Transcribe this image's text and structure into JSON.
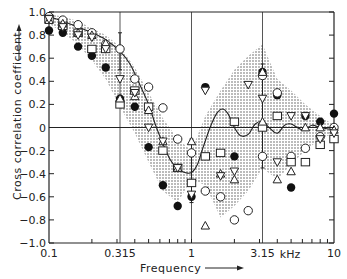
{
  "chart_data": {
    "type": "scatter",
    "title": "",
    "xlabel": "Frequency",
    "xlabel_unit": "kHz",
    "ylabel": "Cross correlation coefficient",
    "xscale": "log",
    "xlim": [
      0.1,
      10
    ],
    "ylim": [
      -1.0,
      1.0
    ],
    "x_ticks": [
      {
        "value": 0.1,
        "label": "0.1"
      },
      {
        "value": 0.315,
        "label": "0.315"
      },
      {
        "value": 1,
        "label": "1"
      },
      {
        "value": 3.15,
        "label": "3.15"
      },
      {
        "value": 10,
        "label": "10"
      }
    ],
    "y_ticks": [
      {
        "value": 1.0,
        "label": "1.0"
      },
      {
        "value": 0.8,
        "label": "0.8"
      },
      {
        "value": 0.6,
        "label": "0.6"
      },
      {
        "value": 0.4,
        "label": "0.4"
      },
      {
        "value": 0.2,
        "label": "0.2"
      },
      {
        "value": 0,
        "label": "0"
      },
      {
        "value": -0.2,
        "label": "-0.2"
      },
      {
        "value": -0.4,
        "label": "-0.4"
      },
      {
        "value": -0.6,
        "label": "-0.6"
      },
      {
        "value": -0.8,
        "label": "-0.8"
      },
      {
        "value": -1.0,
        "label": "-1.0"
      }
    ],
    "grid": {
      "vertical_lines_at": [
        0.315,
        1,
        3.15
      ],
      "horizontal_lines_at": [
        0
      ]
    },
    "shaded_band": {
      "upper": [
        [
          0.1,
          0.98
        ],
        [
          0.125,
          0.96
        ],
        [
          0.16,
          0.92
        ],
        [
          0.2,
          0.86
        ],
        [
          0.25,
          0.8
        ],
        [
          0.315,
          0.7
        ],
        [
          0.4,
          0.52
        ],
        [
          0.5,
          0.3
        ],
        [
          0.63,
          0.08
        ],
        [
          0.8,
          -0.1
        ],
        [
          1.0,
          -0.2
        ],
        [
          1.25,
          0.1
        ],
        [
          1.6,
          0.32
        ],
        [
          2.0,
          0.5
        ],
        [
          2.5,
          0.62
        ],
        [
          3.15,
          0.72
        ],
        [
          3.6,
          0.55
        ],
        [
          4.0,
          0.42
        ],
        [
          5.0,
          0.32
        ],
        [
          6.3,
          0.2
        ],
        [
          8.0,
          0.1
        ],
        [
          10,
          0.02
        ]
      ],
      "lower": [
        [
          10,
          -0.05
        ],
        [
          8.0,
          -0.1
        ],
        [
          6.3,
          -0.2
        ],
        [
          5.0,
          -0.32
        ],
        [
          4.0,
          -0.45
        ],
        [
          3.15,
          -0.35
        ],
        [
          2.5,
          -0.55
        ],
        [
          2.0,
          -0.68
        ],
        [
          1.6,
          -0.78
        ],
        [
          1.25,
          -0.5
        ],
        [
          1.0,
          -0.45
        ],
        [
          0.8,
          -0.65
        ],
        [
          0.63,
          -0.55
        ],
        [
          0.5,
          -0.3
        ],
        [
          0.4,
          -0.05
        ],
        [
          0.315,
          0.18
        ],
        [
          0.25,
          0.42
        ],
        [
          0.2,
          0.58
        ],
        [
          0.16,
          0.72
        ],
        [
          0.125,
          0.82
        ],
        [
          0.1,
          0.9
        ]
      ]
    },
    "fit_curve": [
      [
        0.1,
        0.96
      ],
      [
        0.125,
        0.92
      ],
      [
        0.16,
        0.87
      ],
      [
        0.2,
        0.82
      ],
      [
        0.25,
        0.76
      ],
      [
        0.315,
        0.66
      ],
      [
        0.37,
        0.55
      ],
      [
        0.43,
        0.38
      ],
      [
        0.5,
        0.2
      ],
      [
        0.56,
        0.02
      ],
      [
        0.63,
        -0.14
      ],
      [
        0.71,
        -0.28
      ],
      [
        0.8,
        -0.36
      ],
      [
        0.9,
        -0.39
      ],
      [
        1.0,
        -0.39
      ],
      [
        1.1,
        -0.32
      ],
      [
        1.2,
        -0.18
      ],
      [
        1.35,
        0.0
      ],
      [
        1.5,
        0.12
      ],
      [
        1.65,
        0.16
      ],
      [
        1.8,
        0.12
      ],
      [
        2.0,
        0.0
      ],
      [
        2.2,
        -0.07
      ],
      [
        2.5,
        -0.06
      ],
      [
        2.8,
        0.03
      ],
      [
        3.15,
        0.05
      ],
      [
        3.5,
        0.0
      ],
      [
        4.0,
        -0.05
      ],
      [
        4.5,
        0.02
      ],
      [
        5.0,
        0.03
      ],
      [
        6.0,
        -0.02
      ],
      [
        7.0,
        0.02
      ],
      [
        8.0,
        0.0
      ],
      [
        10,
        -0.02
      ]
    ],
    "error_bars": [
      {
        "x": 0.315,
        "y_low": 0.5,
        "y_high": 0.82
      },
      {
        "x": 1.0,
        "y_low": -0.65,
        "y_high": -0.1
      },
      {
        "x": 3.15,
        "y_low": -0.35,
        "y_high": 0.55
      }
    ],
    "series": [
      {
        "name": "filled-circle",
        "marker": "circle-filled",
        "points": [
          [
            0.1,
            0.84
          ],
          [
            0.125,
            0.82
          ],
          [
            0.16,
            0.7
          ],
          [
            0.2,
            0.62
          ],
          [
            0.25,
            0.52
          ],
          [
            0.315,
            0.25
          ],
          [
            0.4,
            0.18
          ],
          [
            0.5,
            -0.17
          ],
          [
            0.63,
            -0.5
          ],
          [
            0.8,
            -0.68
          ],
          [
            1.0,
            -0.6
          ],
          [
            1.25,
            0.35
          ],
          [
            2.0,
            -0.25
          ],
          [
            3.15,
            0.48
          ],
          [
            4.0,
            0.28
          ],
          [
            5.0,
            -0.52
          ],
          [
            6.3,
            0.1
          ],
          [
            8.0,
            0.05
          ],
          [
            10,
            0.12
          ]
        ]
      },
      {
        "name": "open-circle",
        "marker": "circle-open",
        "points": [
          [
            0.1,
            0.96
          ],
          [
            0.125,
            0.93
          ],
          [
            0.16,
            0.89
          ],
          [
            0.2,
            0.82
          ],
          [
            0.25,
            0.72
          ],
          [
            0.315,
            0.68
          ],
          [
            0.4,
            0.42
          ],
          [
            0.5,
            0.35
          ],
          [
            0.63,
            0.17
          ],
          [
            0.8,
            -0.1
          ],
          [
            1.0,
            -0.22
          ],
          [
            1.25,
            -0.55
          ],
          [
            1.6,
            -0.6
          ],
          [
            2.0,
            -0.8
          ],
          [
            2.5,
            -0.72
          ],
          [
            3.15,
            0.45
          ],
          [
            3.15,
            -0.25
          ],
          [
            4.0,
            0.3
          ],
          [
            5.0,
            -0.25
          ],
          [
            6.3,
            -0.18
          ],
          [
            8.0,
            -0.08
          ],
          [
            10,
            0.0
          ]
        ]
      },
      {
        "name": "open-square",
        "marker": "square-open",
        "points": [
          [
            0.1,
            0.94
          ],
          [
            0.125,
            0.88
          ],
          [
            0.16,
            0.82
          ],
          [
            0.2,
            0.68
          ],
          [
            0.25,
            0.68
          ],
          [
            0.315,
            0.2
          ],
          [
            0.4,
            0.32
          ],
          [
            0.5,
            0.18
          ],
          [
            0.63,
            -0.2
          ],
          [
            0.8,
            -0.35
          ],
          [
            1.0,
            -0.48
          ],
          [
            1.25,
            -0.25
          ],
          [
            1.6,
            -0.22
          ],
          [
            2.0,
            0.05
          ],
          [
            3.15,
            0.0
          ],
          [
            4.0,
            0.1
          ],
          [
            5.0,
            -0.3
          ],
          [
            6.3,
            -0.3
          ],
          [
            8.0,
            -0.15
          ],
          [
            10,
            -0.1
          ]
        ]
      },
      {
        "name": "open-triangle",
        "marker": "triangle-open",
        "points": [
          [
            0.1,
            0.93
          ],
          [
            0.125,
            0.9
          ],
          [
            0.16,
            0.82
          ],
          [
            0.2,
            0.8
          ],
          [
            0.25,
            0.73
          ],
          [
            0.315,
            0.25
          ],
          [
            0.4,
            0.27
          ],
          [
            0.5,
            0.15
          ],
          [
            0.63,
            -0.12
          ],
          [
            0.8,
            -0.35
          ],
          [
            1.0,
            -0.12
          ],
          [
            1.25,
            -0.85
          ],
          [
            1.6,
            -0.4
          ],
          [
            2.0,
            -0.45
          ],
          [
            3.15,
            0.48
          ],
          [
            3.15,
            0.05
          ],
          [
            4.0,
            -0.45
          ],
          [
            5.0,
            -0.38
          ],
          [
            6.3,
            0.0
          ],
          [
            8.0,
            0.0
          ],
          [
            10,
            -0.02
          ]
        ]
      },
      {
        "name": "open-inverted-triangle",
        "marker": "triangle-down-open",
        "points": [
          [
            0.1,
            0.94
          ],
          [
            0.125,
            0.87
          ],
          [
            0.16,
            0.8
          ],
          [
            0.2,
            0.78
          ],
          [
            0.25,
            0.68
          ],
          [
            0.315,
            0.42
          ],
          [
            0.4,
            0.3
          ],
          [
            0.5,
            0.0
          ],
          [
            0.63,
            -0.12
          ],
          [
            0.8,
            -0.35
          ],
          [
            1.0,
            -0.58
          ],
          [
            1.25,
            0.32
          ],
          [
            1.6,
            -0.42
          ],
          [
            2.0,
            -0.38
          ],
          [
            2.5,
            0.37
          ],
          [
            3.15,
            0.25
          ],
          [
            4.0,
            -0.3
          ],
          [
            5.0,
            0.1
          ],
          [
            6.3,
            0.1
          ],
          [
            8.0,
            -0.1
          ],
          [
            10,
            -0.05
          ]
        ]
      }
    ]
  },
  "labels": {
    "ylabel": "Cross correlation coefficient",
    "xlabel": "Frequency",
    "unit": "kHz"
  }
}
